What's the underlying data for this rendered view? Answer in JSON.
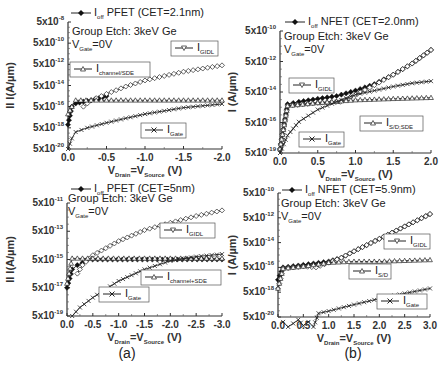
{
  "figure": {
    "panel_labels": [
      "(a)",
      "(b)"
    ],
    "xlabel_main": "V",
    "xlabel_sub1": "Drain",
    "xlabel_mid": "=V",
    "xlabel_sub2": "Source",
    "xlabel_unit": " (V)",
    "annotation_line1": "Group Etch: 3keV Ge",
    "annotation_line2_main": "V",
    "annotation_line2_sub": "Gate",
    "annotation_line2_rest": "=0V"
  },
  "chart_data": [
    {
      "type": "line",
      "panel": "top-left",
      "title": "I_off PFET (CET=2.1nm)",
      "ylabel": "II I(A/µm)",
      "xlabel": "V_Drain=V_Source (V)",
      "yscale": "log",
      "xlim": [
        0.0,
        -2.0
      ],
      "ylim": [
        5e-20,
        5e-08
      ],
      "xticks": [
        "0.0",
        "-0.5",
        "-1.0",
        "-1.5",
        "-2.0"
      ],
      "yticks": [
        "5x10-8",
        "5x10-10",
        "5x10-12",
        "5x10-14",
        "5x10-16",
        "5x10-18",
        "5x10-20"
      ],
      "legend": [
        "I_off PFET (CET=2.1nm)",
        "I_GIDL",
        "I_channel/SDE",
        "I_Gate"
      ],
      "series": [
        {
          "name": "I_off",
          "marker": "filled-diamond",
          "x": [
            0.0,
            -0.05,
            -0.1,
            -0.2,
            -0.3,
            -0.4,
            -0.5
          ],
          "y": [
            1e-17,
            5e-16,
            1e-15,
            1.5e-15,
            2e-15,
            3e-15,
            5e-15
          ]
        },
        {
          "name": "I_GIDL",
          "marker": "open-diamond",
          "x": [
            -0.2,
            -0.3,
            -0.5,
            -0.75,
            -1.0,
            -1.25,
            -1.5,
            -1.75,
            -2.0
          ],
          "y": [
            5e-16,
            2e-15,
            8e-15,
            4e-14,
            1.5e-13,
            4e-13,
            1e-12,
            2e-12,
            4e-12
          ]
        },
        {
          "name": "I_channel/SDE",
          "marker": "open-triangle",
          "x": [
            0.0,
            -0.05,
            -0.1,
            -0.5,
            -1.0,
            -1.5,
            -2.0
          ],
          "y": [
            1e-16,
            5e-16,
            2e-15,
            2e-15,
            2e-15,
            2e-15,
            2e-15
          ]
        },
        {
          "name": "I_Gate",
          "marker": "x",
          "x": [
            0.0,
            -0.05,
            -0.1,
            -0.25,
            -0.5,
            -0.75,
            -1.0,
            -1.25,
            -1.5,
            -1.75,
            -2.0
          ],
          "y": [
            5e-20,
            5e-19,
            2e-18,
            5e-18,
            1.5e-17,
            4e-17,
            1e-16,
            2e-16,
            4e-16,
            6e-16,
            9e-16
          ]
        }
      ]
    },
    {
      "type": "line",
      "panel": "top-right",
      "title": "I_off NFET (CET=2.0nm)",
      "ylabel": "I (A/µm)",
      "xlabel": "V_Drain=V_Source (V)",
      "yscale": "log",
      "xlim": [
        0.0,
        2.0
      ],
      "ylim": [
        5e-19,
        5e-10
      ],
      "xticks": [
        "0.0",
        "0.5",
        "1.0",
        "1.5",
        "2.0"
      ],
      "yticks": [
        "5x10-10",
        "5x10-12",
        "5x10-14",
        "5x10-16",
        "5x10-19"
      ],
      "legend": [
        "I_off NFET (CET=2.0nm)",
        "I_GIDL",
        "I_S/D;SDE",
        "I_Gate"
      ],
      "series": [
        {
          "name": "I_off",
          "marker": "filled-diamond",
          "x": [
            0.0,
            0.1,
            0.25,
            0.5,
            0.75,
            1.0,
            1.25,
            1.5,
            1.75,
            2.0
          ],
          "y": [
            1e-18,
            2e-15,
            3e-15,
            5e-15,
            8e-15,
            2e-14,
            6e-14,
            3e-13,
            2e-12,
            2e-11
          ]
        },
        {
          "name": "I_GIDL",
          "marker": "open-diamond",
          "x": [
            0.0,
            0.1,
            0.5,
            0.8,
            1.0,
            1.25,
            1.5,
            1.75,
            2.0
          ],
          "y": [
            1e-18,
            1.5e-15,
            2.5e-15,
            3e-15,
            1e-14,
            5e-14,
            3e-13,
            2e-12,
            2e-11
          ]
        },
        {
          "name": "I_S/D;SDE",
          "marker": "open-triangle",
          "x": [
            0.0,
            0.1,
            0.5,
            1.0,
            1.5,
            2.0
          ],
          "y": [
            1e-18,
            1.5e-15,
            2.5e-15,
            4e-15,
            5e-15,
            6e-15
          ]
        },
        {
          "name": "I_Gate",
          "marker": "x",
          "x": [
            0.0,
            0.1,
            0.25,
            0.5,
            0.75,
            1.0,
            1.25,
            1.5,
            1.75,
            2.0
          ],
          "y": [
            5e-19,
            1e-17,
            1e-16,
            8e-16,
            3e-15,
            1e-14,
            2e-14,
            4e-14,
            7e-14,
            1e-13
          ]
        }
      ]
    },
    {
      "type": "line",
      "panel": "bottom-left",
      "title": "I_off PFET (CET=5nm)",
      "ylabel": "II I(A/µm)",
      "xlabel": "V_Drain=V_Source (V)",
      "yscale": "log",
      "xlim": [
        0.0,
        -3.0
      ],
      "ylim": [
        5e-19,
        5e-11
      ],
      "xticks": [
        "0.0",
        "-0.5",
        "-1.0",
        "-1.5",
        "-2.0",
        "-2.5",
        "-3.0"
      ],
      "yticks": [
        "5x10-11",
        "5x10-13",
        "5x10-15",
        "5x10-17",
        "5x10-19"
      ],
      "legend": [
        "I_off PFET (CET=5nm)",
        "I_GIDL",
        "I_channel+SDE",
        "I_Gate"
      ],
      "series": [
        {
          "name": "I_off",
          "marker": "filled-diamond",
          "x": [
            0.0,
            -0.1,
            -0.2,
            -0.3,
            -0.4,
            -3.0
          ],
          "y": [
            5e-17,
            1e-15,
            2e-15,
            3e-15,
            5e-15,
            5e-15
          ]
        },
        {
          "name": "I_GIDL",
          "marker": "open-diamond",
          "x": [
            -0.2,
            -0.3,
            -0.5,
            -1.0,
            -1.5,
            -2.0,
            -2.5,
            -3.0
          ],
          "y": [
            5e-16,
            2e-15,
            1e-14,
            1e-13,
            6e-13,
            2e-12,
            6e-12,
            1.5e-11
          ]
        },
        {
          "name": "I_channel+SDE",
          "marker": "open-triangle",
          "x": [
            0.0,
            -0.1,
            -0.5,
            -1.0,
            -2.0,
            -3.0
          ],
          "y": [
            1e-16,
            6e-15,
            6e-15,
            6e-15,
            6e-15,
            6e-15
          ]
        },
        {
          "name": "I_Gate",
          "marker": "x",
          "x": [
            -0.1,
            -0.25,
            -0.5,
            -0.75,
            -1.0,
            -1.5,
            -2.0,
            -2.5,
            -3.0
          ],
          "y": [
            5e-19,
            2e-18,
            1e-17,
            4e-17,
            1.5e-16,
            1e-15,
            4e-15,
            8e-15,
            1.2e-14
          ]
        }
      ]
    },
    {
      "type": "line",
      "panel": "bottom-right",
      "title": "I_off NFET (CET=5.9nm)",
      "ylabel": "I (A/µm)",
      "xlabel": "V_Drain=V_Source (V)",
      "yscale": "log",
      "xlim": [
        0.0,
        3.0
      ],
      "ylim": [
        5e-20,
        5e-10
      ],
      "xticks": [
        "0.0",
        "0.5",
        "1.0",
        "1.5",
        "2.0",
        "2.5",
        "3.0"
      ],
      "yticks": [
        "5x10-10",
        "5x10-12",
        "5x10-14",
        "5x10-16",
        "5x10-18",
        "5x10-20"
      ],
      "legend": [
        "I_off NFET (CET=5.9nm)",
        "I_GIDL",
        "I_S/D",
        "I_Gate"
      ],
      "series": [
        {
          "name": "I_off",
          "marker": "filled-diamond",
          "x": [
            0.0,
            0.1,
            0.5,
            1.0,
            1.25,
            1.5,
            2.0,
            2.5,
            3.0
          ],
          "y": [
            5e-17,
            5e-16,
            8e-16,
            1.5e-15,
            3e-15,
            1e-14,
            1e-13,
            1e-12,
            1e-11
          ]
        },
        {
          "name": "I_GIDL",
          "marker": "open-diamond",
          "x": [
            0.0,
            0.1,
            0.5,
            0.75,
            1.0,
            1.25,
            1.5,
            2.0,
            2.5,
            3.0
          ],
          "y": [
            1e-17,
            4e-16,
            6e-16,
            5e-16,
            1.2e-15,
            3e-15,
            1e-14,
            1e-13,
            1e-12,
            1e-11
          ]
        },
        {
          "name": "I_S/D",
          "marker": "open-triangle",
          "x": [
            0.0,
            0.1,
            0.5,
            1.0,
            1.5,
            2.0,
            3.0
          ],
          "y": [
            1e-17,
            4e-16,
            6e-16,
            1.2e-15,
            1.5e-15,
            1.5e-15,
            2e-15
          ]
        },
        {
          "name": "I_Gate",
          "marker": "x",
          "x": [
            0.1,
            0.2,
            0.3,
            0.4,
            0.5,
            0.6,
            0.7,
            0.8,
            1.0,
            1.5,
            2.0,
            2.5,
            3.0
          ],
          "y": [
            2e-20,
            8e-21,
            1.5e-20,
            3e-20,
            1e-20,
            2e-20,
            8e-21,
            1e-19,
            1.5e-19,
            5e-19,
            1.5e-18,
            4e-18,
            1e-17
          ]
        }
      ]
    }
  ]
}
